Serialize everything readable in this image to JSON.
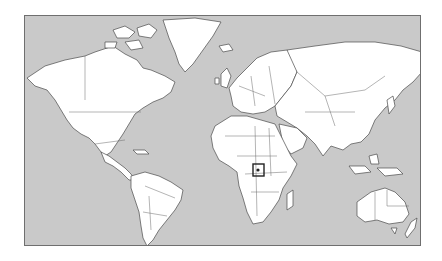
{
  "map": {
    "type": "world-locator-map",
    "projection": "Mercator-like",
    "colors": {
      "ocean": "#c9c9c9",
      "land": "#ffffff",
      "coast": "#4a4a4a",
      "marker": "#222222"
    },
    "highlight": {
      "region": "East Africa (Uganda area)",
      "shape": "square-box"
    }
  }
}
